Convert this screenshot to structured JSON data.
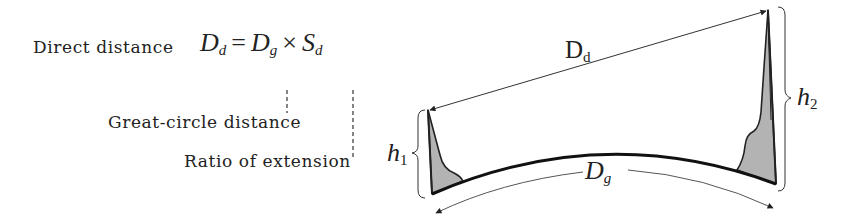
{
  "formula": {
    "prefix": "Direct distance",
    "lhs_main": "D",
    "lhs_sub": "d",
    "equals": "=",
    "term1_main": "D",
    "term1_sub": "g",
    "times": "×",
    "term2_main": "S",
    "term2_sub": "d"
  },
  "annotations": {
    "great_circle": "Great-circle distance",
    "ratio_extension": "Ratio of extension"
  },
  "diagram": {
    "direct_label_main": "D",
    "direct_label_sub": "d",
    "ground_label_main": "D",
    "ground_label_sub": "g",
    "h1_main": "h",
    "h1_sub": "1",
    "h2_main": "h",
    "h2_sub": "2"
  },
  "colors": {
    "ink": "#222222",
    "mountain_fill": "#b3b3b3",
    "thin_line": "#555555"
  }
}
